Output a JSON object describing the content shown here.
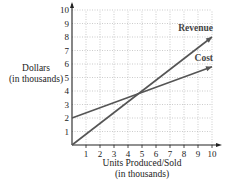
{
  "chart_data": {
    "type": "line",
    "title": "",
    "xlabel": "Units Produced/Sold",
    "xlabel_sub": "(in thousands)",
    "ylabel": "Dollars",
    "ylabel_sub": "(in thousands)",
    "xlim": [
      0,
      10
    ],
    "ylim": [
      0,
      10
    ],
    "x_ticks": [
      1,
      2,
      3,
      4,
      5,
      6,
      7,
      8,
      9,
      10
    ],
    "y_ticks": [
      1,
      2,
      3,
      4,
      5,
      6,
      7,
      8,
      9,
      10
    ],
    "grid": true,
    "grid_style": "dotted",
    "series": [
      {
        "name": "Revenue",
        "x": [
          0,
          10
        ],
        "y": [
          0,
          8
        ],
        "color": "#555555"
      },
      {
        "name": "Cost",
        "x": [
          0,
          10
        ],
        "y": [
          2,
          5.8
        ],
        "color": "#555555"
      }
    ],
    "annotations": [
      {
        "text": "Revenue",
        "near": [
          10,
          8
        ]
      },
      {
        "text": "Cost",
        "near": [
          10,
          5.8
        ]
      }
    ],
    "intersection": [
      5,
      4
    ]
  }
}
